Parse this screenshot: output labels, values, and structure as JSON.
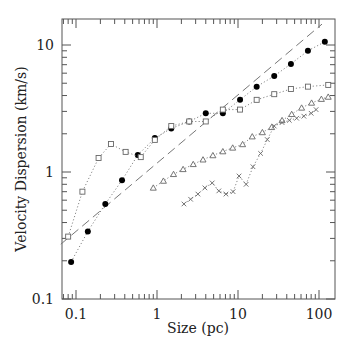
{
  "chart_data": {
    "type": "scatter",
    "title": "",
    "xlabel": "Size (pc)",
    "ylabel": "Velocity Dispersion (km/s)",
    "xscale": "log",
    "yscale": "log",
    "xlim": [
      0.065,
      160
    ],
    "ylim": [
      0.1,
      16
    ],
    "xticks": [
      {
        "value": 0.1,
        "label": "0.1"
      },
      {
        "value": 1,
        "label": "1"
      },
      {
        "value": 10,
        "label": "10"
      },
      {
        "value": 100,
        "label": "100"
      }
    ],
    "yticks": [
      {
        "value": 0.1,
        "label": "0.1"
      },
      {
        "value": 1,
        "label": "1"
      },
      {
        "value": 10,
        "label": "10"
      }
    ],
    "grid": false,
    "legend": null,
    "series": [
      {
        "name": "filled-circles",
        "marker": "filled-circle",
        "line": "dotted",
        "x": [
          0.087,
          0.14,
          0.23,
          0.37,
          0.58,
          0.94,
          1.5,
          2.5,
          4.0,
          6.5,
          10.6,
          17,
          28,
          45,
          73,
          118
        ],
        "y": [
          0.196,
          0.34,
          0.56,
          0.86,
          1.36,
          1.85,
          2.2,
          2.5,
          2.9,
          2.9,
          3.7,
          4.7,
          5.7,
          7.1,
          9.0,
          10.6
        ]
      },
      {
        "name": "open-squares",
        "marker": "open-square",
        "line": "dotted",
        "x": [
          0.08,
          0.12,
          0.19,
          0.27,
          0.41,
          0.63,
          0.94,
          1.5,
          2.5,
          4.0,
          6.5,
          10.6,
          17,
          28,
          45,
          73,
          130
        ],
        "y": [
          0.31,
          0.7,
          1.29,
          1.66,
          1.44,
          1.31,
          1.79,
          2.3,
          2.5,
          2.5,
          3.1,
          3.1,
          3.7,
          4.1,
          4.5,
          4.7,
          4.85
        ]
      },
      {
        "name": "open-triangles",
        "marker": "open-triangle",
        "line": "dotted",
        "x": [
          0.9,
          1.2,
          1.6,
          2.1,
          2.8,
          3.7,
          4.9,
          6.5,
          8.6,
          11.4,
          15,
          20,
          26,
          35,
          46,
          61,
          81,
          107,
          130
        ],
        "y": [
          0.75,
          0.85,
          0.96,
          1.05,
          1.15,
          1.25,
          1.35,
          1.45,
          1.55,
          1.65,
          1.9,
          2.05,
          2.25,
          2.55,
          2.85,
          3.2,
          3.5,
          3.75,
          3.9
        ]
      },
      {
        "name": "crosses",
        "marker": "cross",
        "line": "dotted",
        "x": [
          2.15,
          2.6,
          3.2,
          3.9,
          4.8,
          5.8,
          7.1,
          8.7,
          10.3,
          12.6,
          15.3,
          19,
          23,
          28,
          35,
          43,
          53,
          65,
          80,
          92
        ],
        "y": [
          0.56,
          0.61,
          0.67,
          0.75,
          0.82,
          0.71,
          0.67,
          0.7,
          0.93,
          0.8,
          1.1,
          1.4,
          1.8,
          2.3,
          2.45,
          2.55,
          2.65,
          2.75,
          2.9,
          3.1
        ]
      },
      {
        "name": "dashed-fit",
        "marker": "none",
        "line": "dashed",
        "x": [
          0.065,
          109
        ],
        "y": [
          0.27,
          14.6
        ]
      }
    ]
  }
}
